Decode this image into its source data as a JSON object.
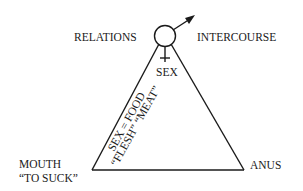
{
  "diagram": {
    "labels": {
      "relations": "RELATIONS",
      "intercourse": "INTERCOURSE",
      "sex": "SEX",
      "mouth": "MOUTH",
      "to_suck": "“TO SUCK”",
      "anus": "ANUS",
      "side_line1": "SEX = FOOD",
      "side_line2": "“FLESH” “MEAT”"
    },
    "symbols": {
      "top": "male-female-symbol"
    }
  }
}
